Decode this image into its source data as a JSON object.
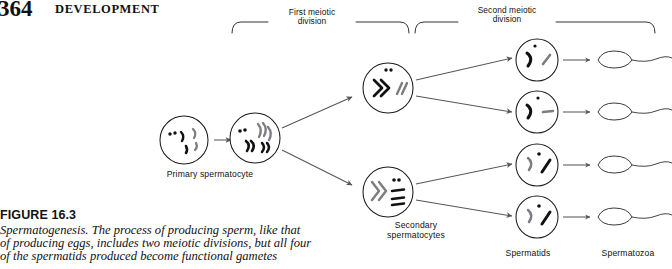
{
  "page": {
    "folio": "364",
    "running_head": "DEVELOPMENT",
    "background_color": "#ffffff",
    "ink_color": "#1b1b1b"
  },
  "figure": {
    "number_label": "FIGURE 16.3",
    "caption": "Spermatogenesis. The process of producing sperm, like that of producing eggs, includes two meiotic divisions, but all four of the spermatids produced become functional gametes",
    "caption_lines": [
      "Spermatogenesis. The process of producing sperm, like that",
      "of producing eggs, includes two meiotic divisions, but all four",
      "of the spermatids produced become functional gametes"
    ],
    "brackets": [
      {
        "id": "first-meiotic-division",
        "label": "First meiotic\ndivision",
        "label_line1": "First meiotic",
        "label_line2": "division"
      },
      {
        "id": "second-meiotic-division",
        "label": "Second meiotic\ndivision",
        "label_line1": "Second meiotic",
        "label_line2": "division"
      }
    ],
    "stages": [
      {
        "id": "primary-spermatocyte",
        "label": "Primary spermatocyte",
        "count": 1
      },
      {
        "id": "secondary-spermatocytes",
        "label_line1": "Secondary",
        "label_line2": "spermatocytes",
        "label": "Secondary spermatocytes",
        "count": 2
      },
      {
        "id": "spermatids",
        "label": "Spermatids",
        "count": 4
      },
      {
        "id": "spermatozoa",
        "label": "Spermatozoa",
        "count": 4
      }
    ]
  }
}
